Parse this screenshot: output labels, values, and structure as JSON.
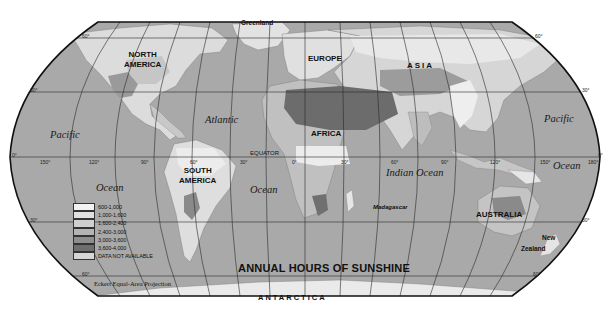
{
  "map": {
    "title": "ANNUAL HOURS OF SUNSHINE",
    "projection": "Eckert Equal-Area Projection",
    "equator_label": "EQUATOR",
    "continents": [
      {
        "id": "north-america",
        "line1": "NORTH",
        "line2": "AMERICA"
      },
      {
        "id": "south-america",
        "line1": "SOUTH",
        "line2": "AMERICA"
      },
      {
        "id": "europe",
        "line1": "EUROPE"
      },
      {
        "id": "asia",
        "line1": "ASIA"
      },
      {
        "id": "africa",
        "line1": "AFRICA"
      },
      {
        "id": "australia",
        "line1": "AUSTRALIA"
      },
      {
        "id": "antarctica",
        "line1": "ANTARCTICA"
      }
    ],
    "places": {
      "greenland": "Greenland",
      "madagascar": "Madagascar",
      "new_zealand_1": "New",
      "new_zealand_2": "Zealand"
    },
    "oceans": {
      "pacific_west": "Pacific",
      "ocean_west": "Ocean",
      "atlantic": "Atlantic",
      "atlantic_ocean": "Ocean",
      "indian": "Indian Ocean",
      "pacific_east": "Pacific",
      "ocean_east": "Ocean"
    },
    "latitude_labels": {
      "n60_left": "60°",
      "n60_right": "60°",
      "n30_left": "30°",
      "n30_right": "30°",
      "eq_left": "0°",
      "eq_right": "0°",
      "s30_left": "30°",
      "s30_right": "30°",
      "s60_left": "60°",
      "s60_right": "60°"
    },
    "longitude_labels": [
      "150°",
      "120°",
      "90°",
      "60°",
      "30°",
      "0°",
      "30°",
      "60°",
      "90°",
      "120°",
      "150°",
      "180°"
    ],
    "legend": {
      "items": [
        {
          "label": "600-1,000",
          "color": "#f2f2f2"
        },
        {
          "label": "1,000-1,600",
          "color": "#e0e0e0"
        },
        {
          "label": "1,600-2,400",
          "color": "#cfcfcf"
        },
        {
          "label": "2,400-3,000",
          "color": "#b4b4b4"
        },
        {
          "label": "3,000-3,600",
          "color": "#8e8e8e"
        },
        {
          "label": "3,600-4,000",
          "color": "#6e6e6e"
        },
        {
          "label": "DATA NOT AVAILABLE",
          "color": "#d6d6d6"
        }
      ]
    },
    "colors": {
      "ocean": "#a9a9a9",
      "land_light": "#e4e4e4",
      "land_mid": "#c4c4c4",
      "land_dark": "#8a8a8a",
      "land_darkest": "#6a6a6a",
      "graticule": "#2a2a2a",
      "border": "#111111"
    }
  }
}
